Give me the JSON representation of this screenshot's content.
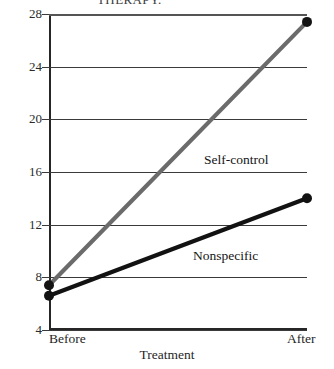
{
  "caption": {
    "text": "THERAPY."
  },
  "chart_data": {
    "type": "line",
    "title": "",
    "xlabel": "Treatment",
    "ylabel": "Social interaction",
    "categories": [
      "Before",
      "After"
    ],
    "x": [
      0,
      1
    ],
    "ylim": [
      4,
      28
    ],
    "yticks": [
      4,
      8,
      12,
      16,
      20,
      24,
      28
    ],
    "ytick_labels": [
      "4",
      "8",
      "12",
      "16",
      "20",
      "24",
      "28"
    ],
    "grid": true,
    "grid_axis": "y",
    "legend": "inline-annotations",
    "series": [
      {
        "name": "Self-control",
        "values": [
          7.4,
          27.4
        ],
        "color": "#6b6b6b",
        "marker": "circle",
        "label_x": 204,
        "label_y": 152
      },
      {
        "name": "Nonspecific",
        "values": [
          6.6,
          14.0
        ],
        "color": "#121212",
        "marker": "circle",
        "label_x": 193,
        "label_y": 248
      }
    ]
  },
  "axis": {
    "x_tick_before": "Before",
    "x_tick_after": "After"
  }
}
